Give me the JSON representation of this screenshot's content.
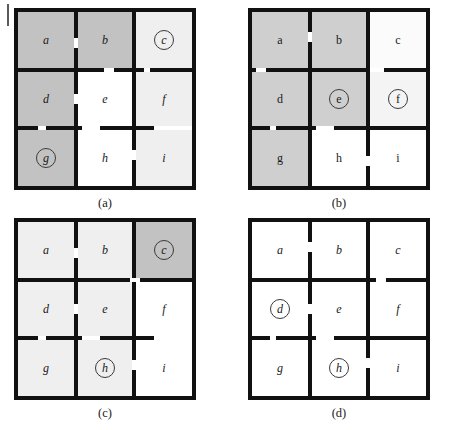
{
  "figure": {
    "edge_tick": "|",
    "grid": {
      "cols": 3,
      "rows": 3,
      "cell_ids": [
        "a",
        "b",
        "c",
        "d",
        "e",
        "f",
        "g",
        "h",
        "i"
      ]
    },
    "colors": {
      "wall": "#111111",
      "dark_gray": "#c2c2c2",
      "mid_gray": "#cfcfcf",
      "light_gray": "#efefef",
      "white": "#ffffff",
      "label_text": "#1a1a1a",
      "marker_stroke": "#3a3a3a"
    },
    "panels": [
      {
        "key": "a",
        "caption": "(a)",
        "labels": {
          "a": "a",
          "b": "b",
          "c": "c",
          "d": "d",
          "e": "e",
          "f": "f",
          "g": "g",
          "h": "h",
          "i": "i"
        },
        "label_style": "italic",
        "markers": [
          "c",
          "g"
        ],
        "shading": {
          "a": "#c2c2c2",
          "b": "#c2c2c2",
          "c": "#efefef",
          "d": "#c2c2c2",
          "e": "#ffffff",
          "f": "#efefef",
          "g": "#c2c2c2",
          "h": "#ffffff",
          "i": "#efefef"
        }
      },
      {
        "key": "b",
        "caption": "(b)",
        "labels": {
          "a": "a",
          "b": "b",
          "c": "c",
          "d": "d",
          "e": "e",
          "f": "f",
          "g": "g",
          "h": "h",
          "i": "i"
        },
        "label_style": "upright",
        "markers": [
          "e",
          "f"
        ],
        "shading": {
          "a": "#cfcfcf",
          "b": "#cfcfcf",
          "c": "#fbfbfb",
          "d": "#cfcfcf",
          "e": "#cfcfcf",
          "f": "#f4f4f4",
          "g": "#cfcfcf",
          "h": "#ffffff",
          "i": "#ffffff"
        }
      },
      {
        "key": "c",
        "caption": "(c)",
        "labels": {
          "a": "a",
          "b": "b",
          "c": "c",
          "d": "d",
          "e": "e",
          "f": "f",
          "g": "g",
          "h": "h",
          "i": "i"
        },
        "label_style": "italic",
        "markers": [
          "c",
          "h"
        ],
        "shading": {
          "a": "#efefef",
          "b": "#efefef",
          "c": "#c2c2c2",
          "d": "#efefef",
          "e": "#efefef",
          "f": "#ffffff",
          "g": "#efefef",
          "h": "#efefef",
          "i": "#ffffff"
        }
      },
      {
        "key": "d",
        "caption": "(d)",
        "labels": {
          "a": "a",
          "b": "b",
          "c": "c",
          "d": "d",
          "e": "e",
          "f": "f",
          "g": "g",
          "h": "h",
          "i": "i"
        },
        "label_style": "italic",
        "markers": [
          "d",
          "h"
        ],
        "shading": {
          "a": "#ffffff",
          "b": "#ffffff",
          "c": "#ffffff",
          "d": "#ffffff",
          "e": "#ffffff",
          "f": "#ffffff",
          "g": "#ffffff",
          "h": "#ffffff",
          "i": "#ffffff"
        }
      }
    ]
  }
}
